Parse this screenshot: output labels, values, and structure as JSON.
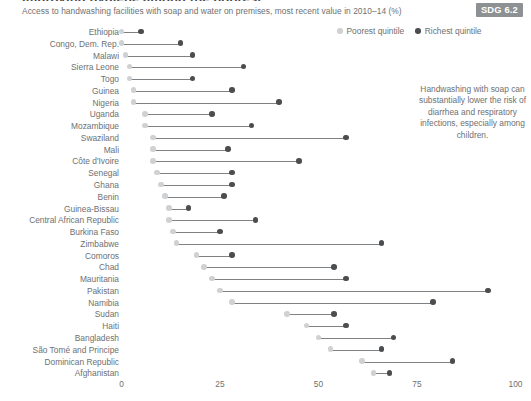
{
  "header": {
    "clipped_title": "Improving hygiene among the poorest",
    "subtitle": "Access to handwashing facilities with soap and water on premises, most recent value in 2010–14 (%)",
    "sdg_badge": "SDG 6.2"
  },
  "legend": {
    "poorest_label": "Poorest quintile",
    "richest_label": "Richest quintile",
    "poorest_color": "#cfd1d2",
    "richest_color": "#4b4d4f"
  },
  "annotation": {
    "text": "Handwashing with soap can substantially lower the risk of diarrhea and respiratory infections, especially among children."
  },
  "chart_data": {
    "type": "bar",
    "subtype": "dumbbell",
    "title": "Access to handwashing facilities with soap and water on premises, most recent value in 2010–14 (%)",
    "xlabel": "",
    "ylabel": "",
    "xlim": [
      0,
      100
    ],
    "xticks": [
      0,
      25,
      50,
      75,
      100
    ],
    "xtick_labels": [
      "0",
      "25",
      "50",
      "75",
      "100"
    ],
    "grid": false,
    "legend_position": "top-right",
    "categories": [
      "Ethiopia",
      "Congo, Dem. Rep.",
      "Malawi",
      "Sierra Leone",
      "Togo",
      "Guinea",
      "Nigeria",
      "Uganda",
      "Mozambique",
      "Swaziland",
      "Mali",
      "Côte d'Ivoire",
      "Senegal",
      "Ghana",
      "Benin",
      "Guinea-Bissau",
      "Central African Republic",
      "Burkina Faso",
      "Zimbabwe",
      "Comoros",
      "Chad",
      "Mauritania",
      "Pakistan",
      "Namibia",
      "Sudan",
      "Haiti",
      "Bangladesh",
      "São Tomé and Principe",
      "Dominican Republic",
      "Afghanistan"
    ],
    "series": [
      {
        "name": "Poorest quintile",
        "values": [
          0,
          0,
          1,
          2,
          2,
          3,
          3,
          6,
          6,
          8,
          8,
          8,
          9,
          10,
          11,
          12,
          12,
          13,
          14,
          19,
          21,
          23,
          25,
          28,
          42,
          47,
          50,
          53,
          61,
          64
        ]
      },
      {
        "name": "Richest quintile",
        "values": [
          5,
          15,
          18,
          31,
          18,
          28,
          40,
          23,
          33,
          57,
          27,
          45,
          28,
          28,
          26,
          17,
          34,
          25,
          66,
          28,
          54,
          57,
          93,
          79,
          54,
          57,
          69,
          66,
          84,
          68
        ]
      }
    ]
  },
  "axis": {
    "tick_labels": [
      "0",
      "25",
      "50",
      "75",
      "100"
    ]
  }
}
